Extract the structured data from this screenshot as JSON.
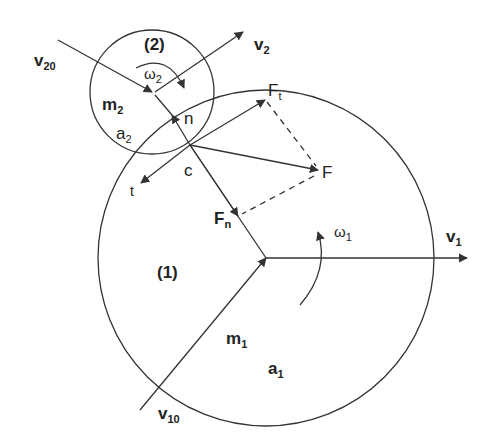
{
  "diagram": {
    "type": "collision of two rotating disks",
    "colors": {
      "stroke": "#333333",
      "text": "#222222",
      "background": "#ffffff"
    },
    "body1": {
      "label": "(1)",
      "mass": "m",
      "mass_sub": "1",
      "radius": "a",
      "radius_sub": "1",
      "omega": "ω",
      "omega_sub": "1"
    },
    "body2": {
      "label": "(2)",
      "mass": "m",
      "mass_sub": "2",
      "radius": "a",
      "radius_sub": "2",
      "omega": "ω",
      "omega_sub": "2"
    },
    "vectors": {
      "v1": {
        "main": "v",
        "sub": "1"
      },
      "v2": {
        "main": "v",
        "sub": "2"
      },
      "v10": {
        "main": "v",
        "sub": "10"
      },
      "v20": {
        "main": "v",
        "sub": "20"
      },
      "F": {
        "main": "F"
      },
      "Ft": {
        "main": "F",
        "sub": "t"
      },
      "Fn": {
        "main": "F",
        "sub": "n"
      },
      "n": {
        "main": "n"
      },
      "t": {
        "main": "t"
      }
    },
    "contact_point": "c"
  }
}
